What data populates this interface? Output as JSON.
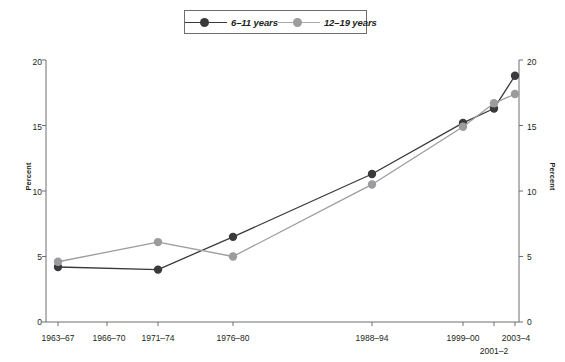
{
  "chart_data": {
    "type": "line",
    "title": "",
    "subtitle": "",
    "xlabel": "",
    "ylabel": "Percent",
    "ylabel_right": "Percent",
    "ylim": [
      0,
      20
    ],
    "yticks": [
      0,
      5,
      10,
      15,
      20
    ],
    "ytick_labels": [
      "0",
      "5",
      "10",
      "15",
      "20"
    ],
    "grid": false,
    "legend_position": "top-center",
    "categories": [
      "1963–67",
      "1966–70",
      "1971–74",
      "1976–80",
      "1988–94",
      "1999–00",
      "2001–2",
      "2003–4"
    ],
    "series": [
      {
        "name": "6–11 years",
        "color": "#3a3a3c",
        "values": [
          4.2,
          null,
          4.0,
          6.5,
          11.3,
          15.2,
          16.3,
          18.8
        ]
      },
      {
        "name": "12–19 years",
        "color": "#9c9c9e",
        "values": [
          4.6,
          null,
          6.1,
          5.0,
          10.5,
          14.9,
          16.7,
          17.4
        ]
      }
    ]
  },
  "legend": {
    "items": [
      {
        "label": "6–11 years",
        "color": "#3a3a3c",
        "marker": "circle"
      },
      {
        "label": "12–19 years",
        "color": "#9c9c9e",
        "marker": "circle"
      }
    ]
  },
  "axes": {
    "left_title": "Percent",
    "right_title": "Percent",
    "y_labels": [
      "0",
      "5",
      "10",
      "15",
      "20"
    ],
    "x_labels": [
      "1963–67",
      "1966–70",
      "1971–74",
      "1976–80",
      "1988–94",
      "1999–00",
      "2001–2",
      "2003–4"
    ]
  }
}
